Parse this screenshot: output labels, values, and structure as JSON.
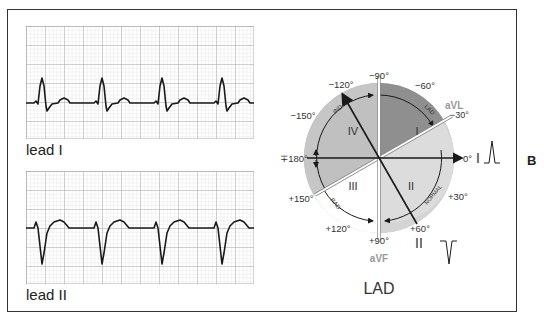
{
  "figure": {
    "panel_letter": "B",
    "title": "LAD",
    "colors": {
      "grid_minor": "#cfcfcf",
      "grid_major": "#9a9a9a",
      "trace": "#1a1a1a",
      "outer_ring": "#b8b8b8",
      "quadrant_I": "#8f8f8f",
      "quadrant_II": "#d6d6d6",
      "quadrant_III": "#ffffff",
      "quadrant_IV": "#c4c4c4",
      "aVL_aVF_label": "#9a9a9a"
    }
  },
  "ecg_strips": [
    {
      "label": "lead I",
      "description": "Upright QRS complexes (positive deflection) with small T waves, 4 beats"
    },
    {
      "label": "lead II",
      "description": "Predominantly negative QRS complexes (deep S waves) with upright T waves, 4 beats"
    }
  ],
  "hexaxial": {
    "angle_labels": {
      "m90": "−90°",
      "m60": "−60°",
      "m30": "−30°",
      "zero": "0°",
      "p30": "+30°",
      "p60": "+60°",
      "p90": "+90°",
      "p120": "+120°",
      "p150": "+150°",
      "pm180": "∓180°",
      "m150": "−150°",
      "m120": "−120°"
    },
    "quadrants": {
      "q1": "I",
      "q2": "II",
      "q3": "III",
      "q4": "IV"
    },
    "arc_labels": {
      "ind": "IND",
      "lad": "LAD",
      "normal": "NORMAL",
      "rad": "RAD"
    },
    "lead_labels": {
      "avl": "aVL",
      "avf": "aVF",
      "lead1": "I",
      "lead2": "II"
    },
    "mini_complexes": {
      "lead1": "positive",
      "lead2": "negative"
    }
  }
}
